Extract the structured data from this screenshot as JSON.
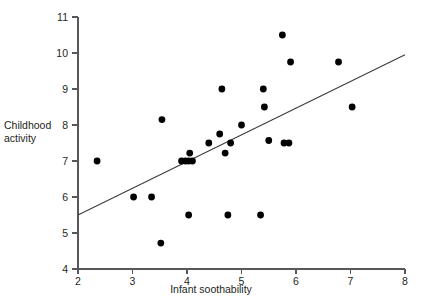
{
  "chart_data": {
    "type": "scatter",
    "title": "",
    "xlabel": "Infant soothability",
    "ylabel": "Childhood\nactivity",
    "xlim": [
      2,
      8
    ],
    "ylim": [
      4,
      11
    ],
    "xticks": [
      2,
      3,
      4,
      5,
      6,
      7,
      8
    ],
    "yticks": [
      4,
      5,
      6,
      7,
      8,
      9,
      10,
      11
    ],
    "xtick_labels": [
      "2",
      "3",
      "4",
      "5",
      "6",
      "7",
      "8"
    ],
    "ytick_labels": [
      "4",
      "5",
      "6",
      "7",
      "8",
      "9",
      "10",
      "11"
    ],
    "grid": false,
    "legend": false,
    "marker_color": "#000000",
    "line_color": "#3b3b3d",
    "axis_color": "#58585a",
    "points": [
      {
        "x": 2.35,
        "y": 7.0
      },
      {
        "x": 3.02,
        "y": 6.0
      },
      {
        "x": 3.35,
        "y": 6.0
      },
      {
        "x": 3.52,
        "y": 4.72
      },
      {
        "x": 3.54,
        "y": 8.15
      },
      {
        "x": 3.9,
        "y": 7.0
      },
      {
        "x": 3.97,
        "y": 7.0
      },
      {
        "x": 4.03,
        "y": 7.0
      },
      {
        "x": 4.05,
        "y": 7.22
      },
      {
        "x": 4.1,
        "y": 7.0
      },
      {
        "x": 4.03,
        "y": 5.5
      },
      {
        "x": 4.4,
        "y": 7.5
      },
      {
        "x": 4.6,
        "y": 7.75
      },
      {
        "x": 4.64,
        "y": 9.0
      },
      {
        "x": 4.7,
        "y": 7.22
      },
      {
        "x": 4.75,
        "y": 5.5
      },
      {
        "x": 4.8,
        "y": 7.5
      },
      {
        "x": 5.0,
        "y": 8.0
      },
      {
        "x": 5.35,
        "y": 5.5
      },
      {
        "x": 5.4,
        "y": 9.0
      },
      {
        "x": 5.42,
        "y": 8.5
      },
      {
        "x": 5.5,
        "y": 7.57
      },
      {
        "x": 5.75,
        "y": 10.5
      },
      {
        "x": 5.78,
        "y": 7.5
      },
      {
        "x": 5.87,
        "y": 7.5
      },
      {
        "x": 5.9,
        "y": 9.75
      },
      {
        "x": 6.78,
        "y": 9.75
      },
      {
        "x": 7.03,
        "y": 8.5
      }
    ],
    "trend_line": {
      "x_start": 2.0,
      "y_start": 5.5,
      "x_end": 8.0,
      "y_end": 9.95
    }
  }
}
